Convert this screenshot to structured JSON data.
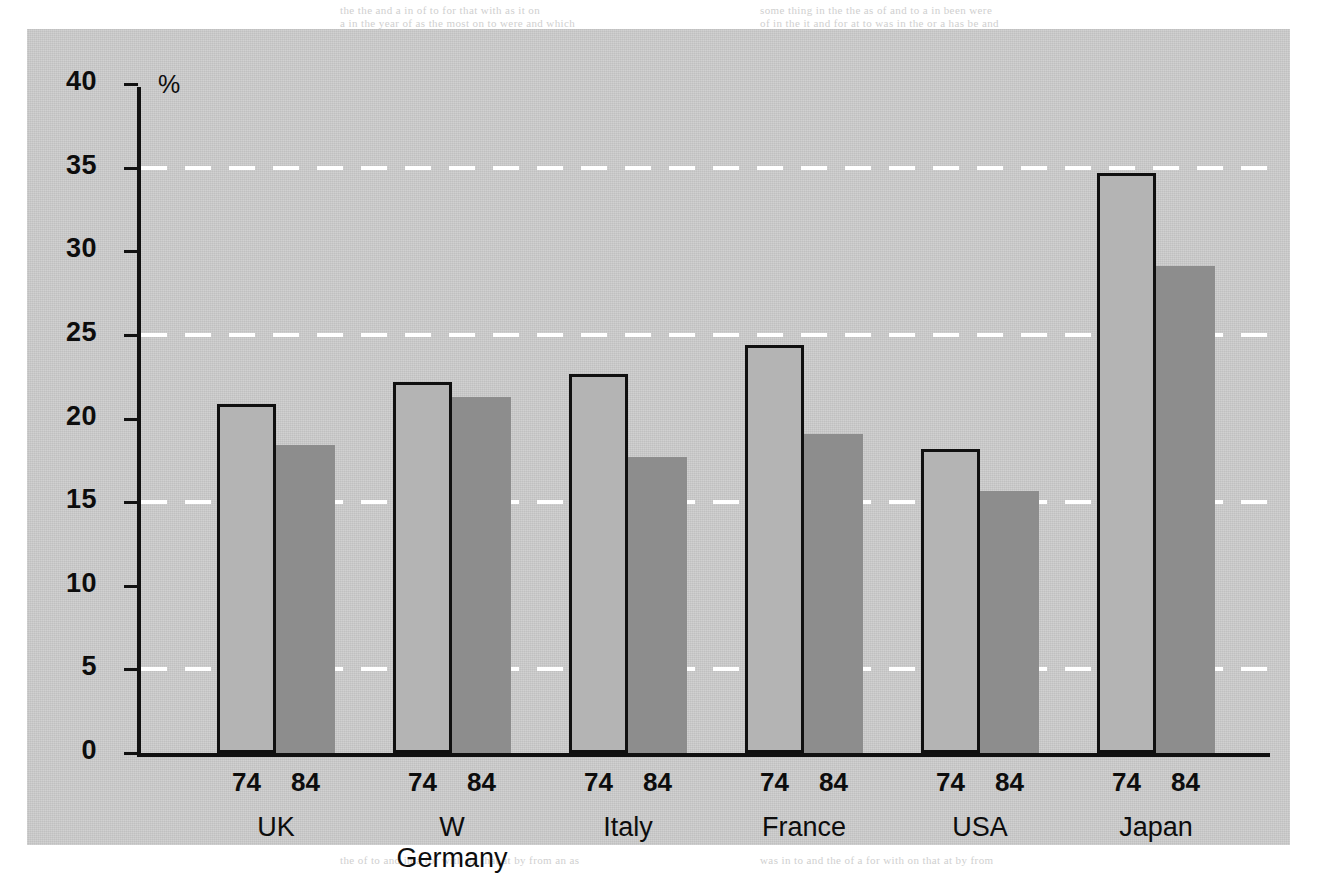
{
  "chart_data": {
    "type": "bar",
    "title": "",
    "subtitle": "",
    "xlabel": "",
    "ylabel": "%",
    "ylim": [
      0,
      40
    ],
    "ytick_step": 5,
    "yticks": [
      0,
      5,
      10,
      15,
      20,
      25,
      30,
      35,
      40
    ],
    "ytick_labels": [
      "0",
      "5",
      "10",
      "15",
      "20",
      "25",
      "30",
      "35",
      "40"
    ],
    "gridlines": [
      5,
      15,
      25,
      35
    ],
    "grid": true,
    "grid_style": "dashed-white",
    "legend": "none",
    "categories": [
      "UK",
      "W Germany",
      "Italy",
      "France",
      "USA",
      "Japan"
    ],
    "series": [
      {
        "name": "74",
        "values": [
          20.7,
          22.0,
          22.5,
          24.2,
          18.0,
          34.5
        ]
      },
      {
        "name": "84",
        "values": [
          18.4,
          21.3,
          17.7,
          19.1,
          15.7,
          29.1
        ]
      }
    ],
    "series_labels_per_group": [
      "74",
      "84"
    ]
  },
  "axis": {
    "percent_symbol": "%"
  },
  "colors": {
    "panel_background": "#cbcbcb",
    "page_background": "#ffffff",
    "bar_74_fill": "#b4b4b4",
    "bar_74_border": "#101010",
    "bar_84_fill": "#8d8d8d",
    "axis": "#111111",
    "gridline": "#ffffff",
    "text": "#0d0d0d"
  },
  "bleed_through_text": [
    "the the and a in of to for that with as it on",
    "some thing in the the as of and to a in been were",
    "a in the year of as the most on to were and which",
    "of in the it and for at to was in the or a has be and",
    "the of to and in a for with on that at by from an as",
    "was in to and the of a for with on that at by from"
  ]
}
